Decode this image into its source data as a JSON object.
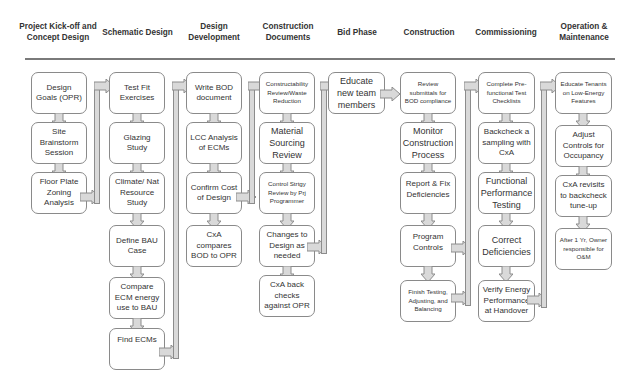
{
  "colors": {
    "arrow_fill": "#d9d9d9",
    "arrow_stroke": "#8c8c8c",
    "box_border": "#8a8a8a",
    "header_line": "#7a7a7a"
  },
  "phases": [
    {
      "header": "Project Kick-off and Concept Design",
      "steps": [
        "Design Goals (OPR)",
        "Site Brainstorm Session",
        "Floor Plate Zoning Analysis"
      ]
    },
    {
      "header": "Schematic Design",
      "steps": [
        "Test Fit Exercises",
        "Glazing Study",
        "Climate/ Nat Resource Study",
        "Define BAU Case",
        "Compare ECM energy use to BAU",
        "Find ECMs"
      ]
    },
    {
      "header": "Design Development",
      "steps": [
        "Write BOD document",
        "LCC Analysis of ECMs",
        "Confirm Cost of Design",
        "CxA compares BOD to OPR"
      ]
    },
    {
      "header": "Construction Documents",
      "steps": [
        "Constructability Review/Waste Reduction",
        "Material Sourcing Review",
        "Control Strtgy Review by Prj Programmer",
        "Changes to Design as needed",
        "CxA back checks against OPR"
      ]
    },
    {
      "header": "Bid Phase",
      "steps": [
        "Educate new team members"
      ]
    },
    {
      "header": "Construction",
      "steps": [
        "Review submittals for BOD compliance",
        "Monitor Construction Process",
        "Report & Fix Deficiencies",
        "Program Controls",
        "Finish Testing, Adjusting, and Balancing"
      ]
    },
    {
      "header": "Commissioning",
      "steps": [
        "Complete Pre-functional Test Checklists",
        "Backcheck a sampling with CxA",
        "Functional Performance Testing",
        "Correct Deficiencies",
        "Verify Energy Performance at Handover"
      ]
    },
    {
      "header": "Operation & Maintenance",
      "steps": [
        "Educate Tenants on Low-Energy Features",
        "Adjust Controls for Occupancy",
        "CxA revisits to backcheck tune-up",
        "After 1 Yr, Owner responsible for O&M"
      ]
    }
  ]
}
